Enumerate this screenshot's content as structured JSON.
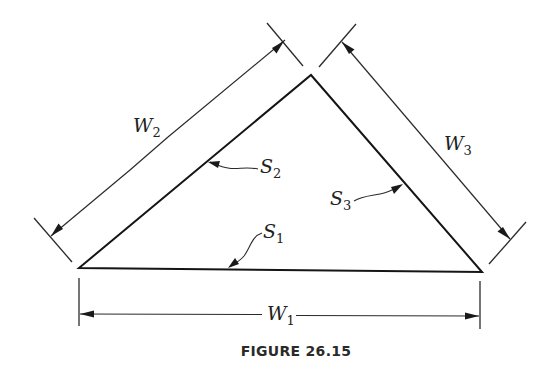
{
  "figure": {
    "caption": "FIGURE 26.15",
    "shape": "triangle",
    "sides": [
      {
        "id": "S1",
        "label": "S",
        "subscript": "1",
        "description": "base side"
      },
      {
        "id": "S2",
        "label": "S",
        "subscript": "2",
        "description": "left side"
      },
      {
        "id": "S3",
        "label": "S",
        "subscript": "3",
        "description": "right side"
      }
    ],
    "dimensions": [
      {
        "id": "W1",
        "label": "W",
        "subscript": "1",
        "measures": "S1"
      },
      {
        "id": "W2",
        "label": "W",
        "subscript": "2",
        "measures": "S2"
      },
      {
        "id": "W3",
        "label": "W",
        "subscript": "3",
        "measures": "S3"
      }
    ],
    "colors": {
      "stroke": "#1a1a1a",
      "background": "#ffffff"
    }
  }
}
